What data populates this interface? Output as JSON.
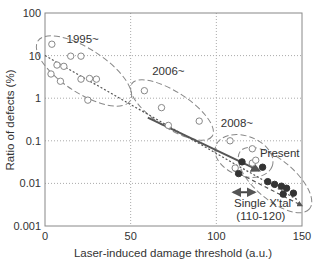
{
  "chart_data": {
    "type": "scatter",
    "title": "",
    "xlabel": "Laser-induced damage threshold (a.u.)",
    "ylabel": "Ratio of defects (%)",
    "xlim": [
      0,
      150
    ],
    "ylim": [
      0.001,
      100
    ],
    "yscale": "log",
    "grid": true,
    "x_ticks": [
      "0",
      "50",
      "100",
      "150"
    ],
    "y_ticks": [
      "0.001",
      "0.01",
      "0.1",
      "1",
      "10",
      "100"
    ],
    "series": [
      {
        "name": "1995~",
        "marker": "open-circle",
        "points": [
          [
            4,
            18.5
          ],
          [
            7,
            6
          ],
          [
            11,
            5.6
          ],
          [
            15,
            9.7
          ],
          [
            21,
            9.7
          ],
          [
            3.5,
            3.7
          ],
          [
            9,
            2.5
          ],
          [
            21,
            2.8
          ],
          [
            26,
            2.9
          ],
          [
            30,
            2.8
          ],
          [
            25,
            0.9
          ]
        ]
      },
      {
        "name": "2006~",
        "marker": "open-circle",
        "points": [
          [
            58,
            1.5
          ],
          [
            68,
            0.6
          ],
          [
            90,
            0.29
          ],
          [
            72,
            0.23
          ]
        ]
      },
      {
        "name": "2008~",
        "marker": "open-circle",
        "points": [
          [
            108,
            0.1
          ],
          [
            121,
            0.065
          ],
          [
            121,
            0.03
          ],
          [
            111,
            0.023
          ],
          [
            123,
            0.035
          ]
        ]
      },
      {
        "name": "Present",
        "marker": "filled-circle",
        "points": [
          [
            115,
            0.032
          ],
          [
            113,
            0.017
          ],
          [
            127,
            0.024
          ],
          [
            130,
            0.011
          ],
          [
            134,
            0.0095
          ],
          [
            138,
            0.0086
          ],
          [
            141,
            0.0077
          ],
          [
            139,
            0.0056
          ],
          [
            145,
            0.0059
          ]
        ]
      }
    ],
    "trend_lines": [
      {
        "style": "dotted",
        "from": [
          0,
          10
        ],
        "to": [
          148,
          0.004
        ]
      },
      {
        "style": "solid-arrow",
        "from": [
          60,
          0.35
        ],
        "to": [
          125,
          0.02
        ]
      },
      {
        "style": "dashed-arrow",
        "from": [
          110,
          0.02
        ],
        "to": [
          150,
          0.003
        ]
      }
    ],
    "annotations": [
      {
        "text": "1995~",
        "x": 22,
        "y": 20
      },
      {
        "text": "2006~",
        "x": 72,
        "y": 3.5
      },
      {
        "text": "2008~",
        "x": 112,
        "y": 0.21
      },
      {
        "text": "Present",
        "x": 137,
        "y": 0.042
      },
      {
        "text": "Single X'tal",
        "x": 127,
        "y": 0.0028
      },
      {
        "text": "(110-120)",
        "x": 126,
        "y": 0.0014
      }
    ],
    "single_crystal_range": [
      110,
      120
    ]
  }
}
